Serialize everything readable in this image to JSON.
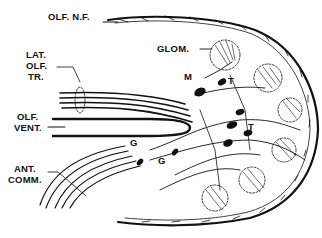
{
  "diagram": {
    "colors": {
      "ink": "#111111",
      "background": "#ffffff"
    },
    "labels": {
      "olf_nf": "OLF. N.F.",
      "glom": "GLOM.",
      "lat_olf_tr_1": "LAT.",
      "lat_olf_tr_2": "OLF.",
      "lat_olf_tr_3": "TR.",
      "olf_vent_1": "OLF.",
      "olf_vent_2": "VENT.",
      "ant_comm_1": "ANT.",
      "ant_comm_2": "COMM.",
      "mitral": "M",
      "tufted_1": "T",
      "tufted_2": "T",
      "granule_1": "G",
      "granule_2": "G"
    },
    "nodes": [
      {
        "id": "olf_nf",
        "name": "Olfactory nerve fibers"
      },
      {
        "id": "glom",
        "name": "Glomeruli"
      },
      {
        "id": "lat_olf_tr",
        "name": "Lateral olfactory tract"
      },
      {
        "id": "olf_vent",
        "name": "Olfactory ventricle"
      },
      {
        "id": "ant_comm",
        "name": "Anterior commissure"
      },
      {
        "id": "M",
        "name": "Mitral cell"
      },
      {
        "id": "T",
        "name": "Tufted cell"
      },
      {
        "id": "G",
        "name": "Granule cell"
      }
    ]
  }
}
